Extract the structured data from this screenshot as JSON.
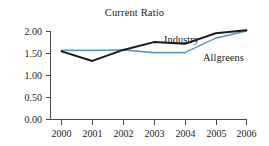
{
  "chart_data": {
    "type": "line",
    "title": "Current Ratio",
    "xlabel": "",
    "ylabel": "",
    "x": [
      "2000",
      "2001",
      "2002",
      "2003",
      "2004",
      "2005",
      "2006"
    ],
    "categories": [
      "2000",
      "2001",
      "2002",
      "2003",
      "2004",
      "2005",
      "2006"
    ],
    "series": [
      {
        "name": "Industry",
        "color": "#1a1a1a",
        "values": [
          1.55,
          1.33,
          1.58,
          1.76,
          1.72,
          1.96,
          2.03
        ]
      },
      {
        "name": "Allgreens",
        "color": "#5b9bbf",
        "values": [
          1.57,
          1.57,
          1.58,
          1.52,
          1.52,
          1.85,
          2.01
        ]
      }
    ],
    "ylim": [
      0.0,
      2.0
    ],
    "yticks": [
      0.0,
      0.5,
      1.0,
      1.5,
      2.0
    ],
    "ytick_labels": [
      "0.00",
      "0.50",
      "1.00",
      "1.50",
      "2.00"
    ],
    "grid": false,
    "legend": "inline-annotations",
    "annotations": [
      {
        "text": "Industry",
        "series": "Industry"
      },
      {
        "text": "Allgreens",
        "series": "Allgreens"
      }
    ]
  },
  "axis": {
    "y_labels": [
      "2.00",
      "1.50",
      "1.00",
      "0.50",
      "0.00"
    ],
    "x_labels": [
      "2000",
      "2001",
      "2002",
      "2003",
      "2004",
      "2005",
      "2006"
    ]
  },
  "labels": {
    "industry": "Industry",
    "allgreens": "Allgreens"
  }
}
